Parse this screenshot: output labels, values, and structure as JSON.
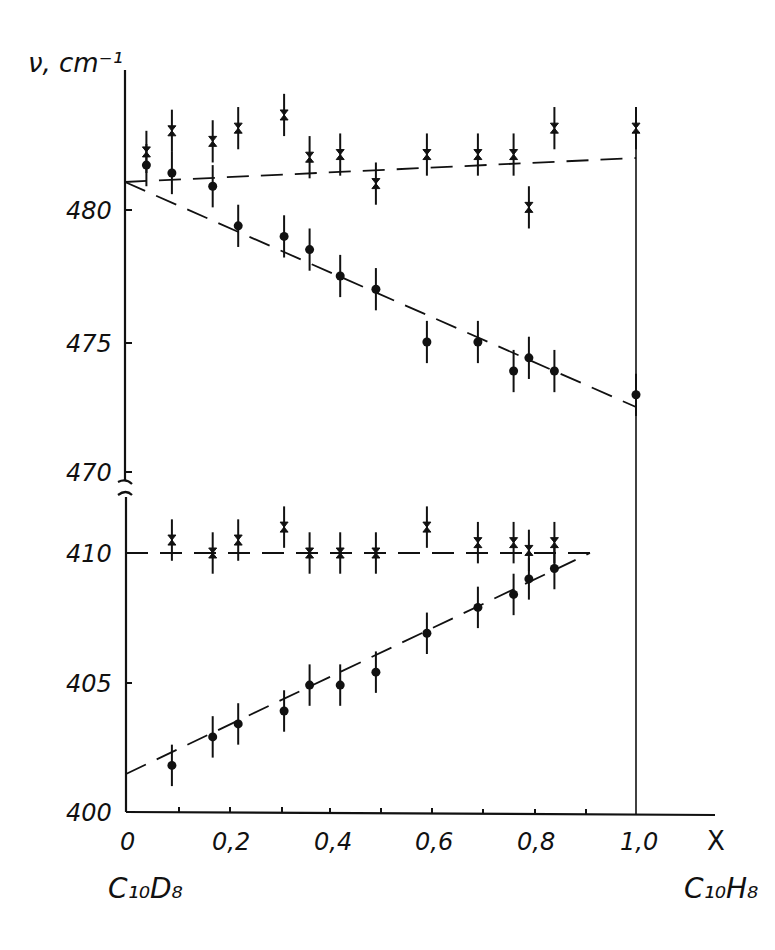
{
  "chart_data": {
    "type": "scatter",
    "title": "",
    "xlabel": "X",
    "ylabel": "ν, cm⁻¹",
    "x_ticks": [
      "0",
      "0,2",
      "0,4",
      "0,6",
      "0,8",
      "1,0"
    ],
    "y_ticks_upper": [
      "470",
      "475",
      "480"
    ],
    "y_ticks_lower": [
      "400",
      "405",
      "410"
    ],
    "x_endpoint_labels": {
      "left": "C₁₀D₈",
      "right": "C₁₀H₈"
    },
    "xlim": [
      0,
      1.1
    ],
    "ylim_upper": [
      469,
      485
    ],
    "ylim_lower": [
      400,
      412
    ],
    "axis_break": true,
    "grid": false,
    "legend": null,
    "series": [
      {
        "name": "upper-cross",
        "marker": "x",
        "x": [
          0.04,
          0.09,
          0.17,
          0.22,
          0.31,
          0.36,
          0.42,
          0.49,
          0.59,
          0.69,
          0.76,
          0.79,
          0.84,
          1.0
        ],
        "y": [
          482.2,
          483.0,
          482.6,
          483.1,
          483.6,
          482.0,
          482.1,
          481.0,
          482.1,
          482.1,
          482.1,
          480.1,
          483.1,
          483.1
        ],
        "err": 0.8,
        "fit": {
          "x": [
            0,
            1.0
          ],
          "y": [
            482.2,
            483.1
          ]
        }
      },
      {
        "name": "upper-circle",
        "marker": "o",
        "x": [
          0.04,
          0.09,
          0.17,
          0.22,
          0.31,
          0.36,
          0.42,
          0.49,
          0.59,
          0.69,
          0.76,
          0.79,
          0.84,
          1.0
        ],
        "y": [
          481.7,
          481.4,
          480.9,
          479.4,
          479.0,
          478.5,
          477.5,
          477.0,
          475.0,
          475.0,
          473.9,
          474.4,
          473.9,
          473.0
        ],
        "err": 0.8,
        "fit": {
          "x": [
            0,
            1.0
          ],
          "y": [
            482.2,
            472.5
          ]
        }
      },
      {
        "name": "lower-cross",
        "marker": "x",
        "x": [
          0.09,
          0.17,
          0.22,
          0.31,
          0.36,
          0.42,
          0.49,
          0.59,
          0.69,
          0.76,
          0.79,
          0.84
        ],
        "y": [
          410.5,
          410.0,
          410.5,
          411.0,
          410.0,
          410.0,
          410.0,
          411.0,
          410.4,
          410.4,
          410.1,
          410.4
        ],
        "err": 0.8,
        "fit": {
          "x": [
            0,
            0.9
          ],
          "y": [
            410.0,
            410.0
          ]
        }
      },
      {
        "name": "lower-circle",
        "marker": "o",
        "x": [
          0.09,
          0.17,
          0.22,
          0.31,
          0.36,
          0.42,
          0.49,
          0.59,
          0.69,
          0.76,
          0.79,
          0.84
        ],
        "y": [
          401.8,
          402.9,
          403.4,
          403.9,
          404.9,
          404.9,
          405.4,
          406.9,
          407.9,
          408.4,
          409.0,
          409.4
        ],
        "err": 0.8,
        "fit": {
          "x": [
            0,
            0.9
          ],
          "y": [
            401.5,
            410.0
          ]
        }
      }
    ]
  }
}
